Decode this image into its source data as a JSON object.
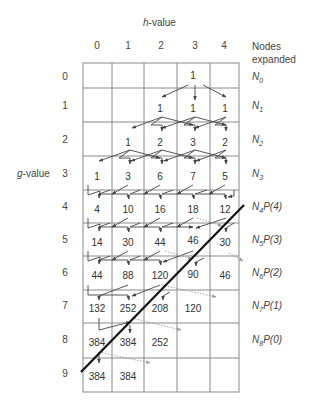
{
  "axes": {
    "x_title_var": "h",
    "x_title_rest": "-value",
    "y_title_var": "g",
    "y_title_rest": "-value",
    "h_ticks": [
      "0",
      "1",
      "2",
      "3",
      "4"
    ],
    "g_ticks": [
      "0",
      "1",
      "2",
      "3",
      "4",
      "5",
      "6",
      "7",
      "8",
      "9"
    ],
    "right_header_line1": "Nodes",
    "right_header_line2": "expanded"
  },
  "rows": [
    {
      "g": 0,
      "values": [
        "",
        "",
        "",
        "1",
        ""
      ],
      "node": {
        "n": "N",
        "sub": "0",
        "p": ""
      }
    },
    {
      "g": 1,
      "values": [
        "",
        "",
        "1",
        "1",
        "1"
      ],
      "node": {
        "n": "N",
        "sub": "1",
        "p": ""
      }
    },
    {
      "g": 2,
      "values": [
        "",
        "1",
        "2",
        "3",
        "2"
      ],
      "node": {
        "n": "N",
        "sub": "2",
        "p": ""
      }
    },
    {
      "g": 3,
      "values": [
        "1",
        "3",
        "6",
        "7",
        "5"
      ],
      "node": {
        "n": "N",
        "sub": "3",
        "p": ""
      }
    },
    {
      "g": 4,
      "values": [
        "4",
        "10",
        "16",
        "18",
        "12"
      ],
      "node": {
        "n": "N",
        "sub": "4",
        "p": "P(4)"
      }
    },
    {
      "g": 5,
      "values": [
        "14",
        "30",
        "44",
        "46",
        "30"
      ],
      "node": {
        "n": "N",
        "sub": "5",
        "p": "P(3)"
      }
    },
    {
      "g": 6,
      "values": [
        "44",
        "88",
        "120",
        "90",
        "46"
      ],
      "node": {
        "n": "N",
        "sub": "6",
        "p": "P(2)"
      }
    },
    {
      "g": 7,
      "values": [
        "132",
        "252",
        "208",
        "120",
        ""
      ],
      "node": {
        "n": "N",
        "sub": "7",
        "p": "P(1)"
      }
    },
    {
      "g": 8,
      "values": [
        "384",
        "384",
        "252",
        "",
        ""
      ],
      "node": {
        "n": "N",
        "sub": "8",
        "p": "P(0)"
      }
    },
    {
      "g": 9,
      "values": [
        "384",
        "384",
        "",
        "",
        ""
      ],
      "node": {
        "n": "",
        "sub": "",
        "p": ""
      }
    }
  ],
  "colors": {
    "grid": "#8a8a8a",
    "arrow": "#444444",
    "dotted_arrow": "#9a9a9a",
    "diagonal": "#111111",
    "text": "#333333"
  },
  "diagonal_line": {
    "x1": 244,
    "y1": 205,
    "x2": 81,
    "y2": 372
  }
}
